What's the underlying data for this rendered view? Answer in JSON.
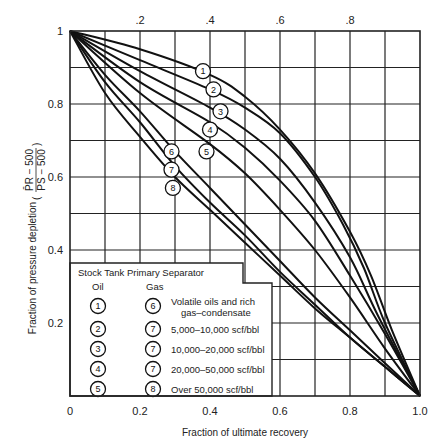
{
  "chart_data": {
    "type": "line",
    "title": "",
    "xlabel": "Fraction of ultimate recovery",
    "ylabel": "Fraction of pressure depletion",
    "ylabel_formula": "(P̄R − 500) / (PS − 500)",
    "xlim": [
      0,
      1.0
    ],
    "ylim": [
      0,
      1.0
    ],
    "grid": true,
    "x_ticks_bottom": [
      "0",
      "0.2",
      "0.4",
      "0.6",
      "0.8",
      "1.0"
    ],
    "x_ticks_top": [
      ".2",
      ".4",
      ".6",
      ".8"
    ],
    "y_ticks": [
      "1",
      "0.8",
      "0.6",
      "0.4",
      "0.2"
    ],
    "series": [
      {
        "name": "1",
        "group": "Oil",
        "points": [
          [
            0,
            1
          ],
          [
            0.2,
            0.95
          ],
          [
            0.4,
            0.88
          ],
          [
            0.5,
            0.82
          ],
          [
            0.6,
            0.73
          ],
          [
            0.7,
            0.61
          ],
          [
            0.8,
            0.45
          ],
          [
            0.86,
            0.33
          ],
          [
            0.92,
            0.18
          ],
          [
            1,
            0
          ]
        ]
      },
      {
        "name": "2",
        "group": "Oil",
        "points": [
          [
            0,
            1
          ],
          [
            0.2,
            0.92
          ],
          [
            0.4,
            0.84
          ],
          [
            0.5,
            0.79
          ],
          [
            0.6,
            0.72
          ],
          [
            0.7,
            0.6
          ],
          [
            0.78,
            0.47
          ],
          [
            0.84,
            0.35
          ],
          [
            0.9,
            0.2
          ],
          [
            1,
            0
          ]
        ]
      },
      {
        "name": "3",
        "group": "Oil",
        "points": [
          [
            0,
            1
          ],
          [
            0.2,
            0.89
          ],
          [
            0.4,
            0.79
          ],
          [
            0.5,
            0.73
          ],
          [
            0.6,
            0.65
          ],
          [
            0.7,
            0.53
          ],
          [
            0.8,
            0.38
          ],
          [
            0.88,
            0.22
          ],
          [
            1,
            0
          ]
        ]
      },
      {
        "name": "4",
        "group": "Oil",
        "points": [
          [
            0,
            1
          ],
          [
            0.2,
            0.86
          ],
          [
            0.4,
            0.75
          ],
          [
            0.5,
            0.68
          ],
          [
            0.6,
            0.59
          ],
          [
            0.7,
            0.48
          ],
          [
            0.8,
            0.33
          ],
          [
            0.9,
            0.17
          ],
          [
            1,
            0
          ]
        ]
      },
      {
        "name": "5",
        "group": "Oil",
        "points": [
          [
            0,
            1
          ],
          [
            0.2,
            0.83
          ],
          [
            0.4,
            0.69
          ],
          [
            0.5,
            0.61
          ],
          [
            0.6,
            0.51
          ],
          [
            0.7,
            0.4
          ],
          [
            0.8,
            0.27
          ],
          [
            0.9,
            0.13
          ],
          [
            1,
            0
          ]
        ]
      },
      {
        "name": "6",
        "group": "Gas",
        "points": [
          [
            0,
            1
          ],
          [
            0.1,
            0.88
          ],
          [
            0.2,
            0.78
          ],
          [
            0.3,
            0.67
          ],
          [
            0.4,
            0.57
          ],
          [
            0.5,
            0.47
          ],
          [
            0.6,
            0.37
          ],
          [
            0.7,
            0.27
          ],
          [
            0.8,
            0.18
          ],
          [
            0.9,
            0.09
          ],
          [
            1,
            0
          ]
        ]
      },
      {
        "name": "7",
        "group": "Gas",
        "points": [
          [
            0,
            1
          ],
          [
            0.1,
            0.86
          ],
          [
            0.2,
            0.75
          ],
          [
            0.3,
            0.63
          ],
          [
            0.4,
            0.53
          ],
          [
            0.5,
            0.44
          ],
          [
            0.6,
            0.34
          ],
          [
            0.7,
            0.25
          ],
          [
            0.8,
            0.16
          ],
          [
            0.9,
            0.08
          ],
          [
            1,
            0
          ]
        ]
      },
      {
        "name": "8",
        "group": "Gas",
        "points": [
          [
            0,
            1
          ],
          [
            0.1,
            0.83
          ],
          [
            0.2,
            0.71
          ],
          [
            0.3,
            0.6
          ],
          [
            0.4,
            0.51
          ],
          [
            0.5,
            0.42
          ],
          [
            0.6,
            0.33
          ],
          [
            0.7,
            0.24
          ],
          [
            0.8,
            0.16
          ],
          [
            0.9,
            0.08
          ],
          [
            1,
            0
          ]
        ]
      }
    ],
    "curve_labels": [
      {
        "id": "1",
        "x": 0.38,
        "y": 0.89
      },
      {
        "id": "2",
        "x": 0.41,
        "y": 0.84
      },
      {
        "id": "3",
        "x": 0.43,
        "y": 0.78
      },
      {
        "id": "4",
        "x": 0.4,
        "y": 0.73
      },
      {
        "id": "5",
        "x": 0.39,
        "y": 0.67
      },
      {
        "id": "6",
        "x": 0.29,
        "y": 0.67
      },
      {
        "id": "7",
        "x": 0.29,
        "y": 0.62
      },
      {
        "id": "8",
        "x": 0.294,
        "y": 0.57
      }
    ],
    "legend": {
      "title": "Stock Tank Primary Separator",
      "oil_header": "Oil",
      "gas_header": "Gas",
      "rows": [
        {
          "oil": "1",
          "gas": "6",
          "text": "Volatile oils and rich",
          "text2": "gas–condensate"
        },
        {
          "oil": "2",
          "gas": "7",
          "text": "5,000–10,000 scf/bbl"
        },
        {
          "oil": "3",
          "gas": "7",
          "text": "10,000–20,000 scf/bbl"
        },
        {
          "oil": "4",
          "gas": "7",
          "text": "20,000–50,000 scf/bbl"
        },
        {
          "oil": "5",
          "gas": "8",
          "text": "Over 50,000 scf/bbl"
        }
      ],
      "position": "lower-left"
    }
  },
  "colors": {
    "line": "#111111",
    "grid": "#222222",
    "background": "#ffffff"
  }
}
